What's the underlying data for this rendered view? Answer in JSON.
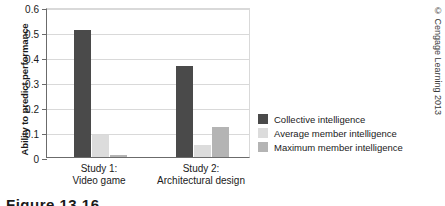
{
  "chart_data": {
    "type": "bar",
    "title": "",
    "subtitle": "",
    "xlabel": "",
    "ylabel": "Ability to predict performance",
    "ylim": [
      0,
      0.6
    ],
    "yticks": [
      "0",
      "0.1",
      "0.2",
      "0.3",
      "0.4",
      "0.5",
      "0.6"
    ],
    "ytick_values": [
      0,
      0.1,
      0.2,
      0.3,
      0.4,
      0.5,
      0.6
    ],
    "grid": "horizontal",
    "legend_position": "right",
    "categories": [
      "Study 1:\nVideo game",
      "Study 2:\nArchitectural design"
    ],
    "category_lines": [
      [
        "Study 1:",
        "Video game"
      ],
      [
        "Study 2:",
        "Architectural design"
      ]
    ],
    "series": [
      {
        "name": "Collective intelligence",
        "color": "#4a4a4a",
        "values": [
          0.51,
          0.365
        ]
      },
      {
        "name": "Average member intelligence",
        "color": "#dcdcdc",
        "values": [
          0.09,
          0.05
        ]
      },
      {
        "name": "Maximum member intelligence",
        "color": "#b4b4b4",
        "values": [
          0.01,
          0.12
        ]
      }
    ]
  },
  "legend": {
    "items": [
      {
        "label": "Collective intelligence",
        "color": "#4a4a4a"
      },
      {
        "label": "Average member intelligence",
        "color": "#dcdcdc"
      },
      {
        "label": "Maximum member intelligence",
        "color": "#b4b4b4"
      }
    ]
  },
  "copyright": {
    "text": "© Cengage Learning 2013"
  },
  "caption": {
    "text": "Figure 13.16"
  }
}
